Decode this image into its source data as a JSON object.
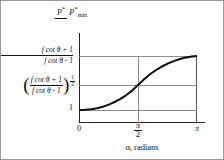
{
  "chart_data": {
    "type": "line",
    "title": "",
    "xlabel": "α, radians",
    "ylabel": "P*/P*min",
    "ylabel_parts": {
      "numerator": "P",
      "numerator_star": "*",
      "denominator": "P",
      "denominator_star": "*",
      "denominator_sub": "min"
    },
    "xlim": [
      0,
      3.14159
    ],
    "ylim": [
      0.85,
      2.0
    ],
    "grid": true,
    "legend": "none",
    "x_ticks": [
      {
        "value": 0,
        "label": "0"
      },
      {
        "value": 1.5708,
        "label": "π/2",
        "numerator": "π",
        "denominator": "2"
      },
      {
        "value": 3.14159,
        "label": "π"
      }
    ],
    "y_ticks": [
      {
        "value": 1.0,
        "label": "1"
      },
      {
        "value": 1.414,
        "label": "((f cot θ + 1)/(f cot θ - 1))^(1/2)",
        "numerator": "f cot θ + 1",
        "denominator": "f cot θ - 1",
        "exponent_numerator": "1",
        "exponent_denominator": "2",
        "left_paren": "(",
        "right_paren": ")"
      },
      {
        "value": 2.0,
        "label": "(f cot θ + 1)/(f cot θ - 1)",
        "numerator": "f cot θ + 1",
        "denominator": "f cot θ - 1"
      }
    ],
    "series": [
      {
        "name": "P*/P*min vs alpha",
        "x": [
          0.0,
          0.157,
          0.314,
          0.471,
          0.628,
          0.785,
          0.942,
          1.1,
          1.257,
          1.414,
          1.571,
          1.728,
          1.885,
          2.042,
          2.199,
          2.356,
          2.513,
          2.67,
          2.827,
          2.985,
          3.142
        ],
        "y": [
          1.0,
          1.003,
          1.013,
          1.03,
          1.055,
          1.089,
          1.132,
          1.185,
          1.248,
          1.322,
          1.414,
          1.506,
          1.588,
          1.657,
          1.716,
          1.765,
          1.806,
          1.84,
          1.866,
          1.884,
          1.895
        ]
      }
    ]
  },
  "axis_label_text": {
    "x_axis_title": "α, radians"
  },
  "colors": {
    "curve": "#111111",
    "grid": "#8d8d8d",
    "axis": "#222222",
    "background": "#ffffff",
    "border": "#9a9a9a"
  }
}
